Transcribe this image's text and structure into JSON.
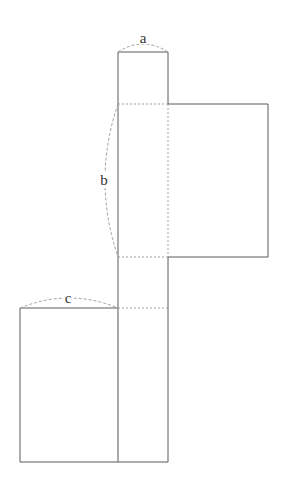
{
  "diagram": {
    "type": "net-of-box",
    "labels": {
      "a": "a",
      "b": "b",
      "c": "c"
    },
    "colors": {
      "line": "#555555",
      "dashed": "#999999",
      "background": "#ffffff"
    }
  }
}
